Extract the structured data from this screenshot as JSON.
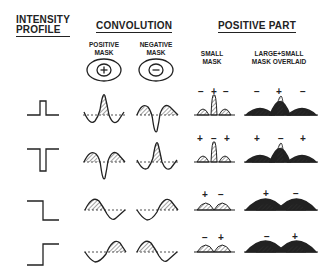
{
  "headers": {
    "intensity_profile": [
      "INTENSITY",
      "PROFILE"
    ],
    "convolution": "CONVOLUTION",
    "positive_part": "POSITIVE PART"
  },
  "subheaders": {
    "positive_mask": [
      "POSITIVE",
      "MASK"
    ],
    "negative_mask": [
      "NEGATIVE",
      "MASK"
    ],
    "small_mask": [
      "SMALL",
      "MASK"
    ],
    "overlaid": [
      "LARGE+SMALL",
      "MASK OVERLAID"
    ]
  },
  "mask_symbols": {
    "positive": "+",
    "negative": "−"
  },
  "rows": [
    {
      "profile": "bar-up",
      "small_signs": [
        "−",
        "+",
        "−"
      ],
      "overlaid_signs": [
        "−",
        "+",
        "−"
      ]
    },
    {
      "profile": "bar-down",
      "small_signs": [
        "+",
        "−",
        "+"
      ],
      "overlaid_signs": [
        "+",
        "−",
        "+"
      ]
    },
    {
      "profile": "step-down",
      "small_signs": [
        "+",
        "−"
      ],
      "overlaid_signs": [
        "+",
        "−"
      ]
    },
    {
      "profile": "step-up",
      "small_signs": [
        "−",
        "+"
      ],
      "overlaid_signs": [
        "−",
        "+"
      ]
    }
  ]
}
